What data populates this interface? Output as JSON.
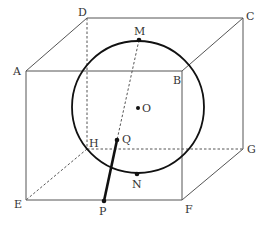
{
  "diagram": {
    "vertices": {
      "A": {
        "label": "A",
        "x": 26,
        "y": 71
      },
      "B": {
        "label": "B",
        "x": 182,
        "y": 71
      },
      "C": {
        "label": "C",
        "x": 243,
        "y": 18
      },
      "D": {
        "label": "D",
        "x": 87,
        "y": 18
      },
      "E": {
        "label": "E",
        "x": 26,
        "y": 200
      },
      "F": {
        "label": "F",
        "x": 182,
        "y": 200
      },
      "G": {
        "label": "G",
        "x": 243,
        "y": 149
      },
      "H": {
        "label": "H",
        "x": 87,
        "y": 149
      }
    },
    "sphere": {
      "center_label": "O",
      "cx": 138,
      "cy": 107,
      "r": 66
    },
    "points": {
      "M": {
        "label": "M",
        "x": 139,
        "y": 40
      },
      "N": {
        "label": "N",
        "x": 137,
        "y": 174
      },
      "O": {
        "label": "O",
        "x": 138,
        "y": 108
      },
      "Q": {
        "label": "Q",
        "x": 117,
        "y": 140
      },
      "P": {
        "label": "P",
        "x": 104,
        "y": 201
      }
    },
    "visible_edges": [
      "AB",
      "BC",
      "CD",
      "DA",
      "AE",
      "EF",
      "FB",
      "FG",
      "GC"
    ],
    "hidden_edges": [
      "DH",
      "HE",
      "HG",
      "MQ"
    ],
    "bold_segments": [
      "PQ"
    ]
  }
}
